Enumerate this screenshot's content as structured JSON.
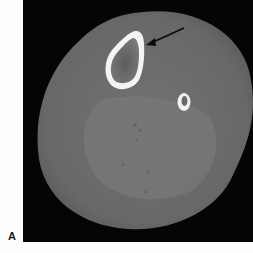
{
  "figure": {
    "panel_label": "A",
    "image_type": "axial CT slice of lower leg",
    "structures": [
      "soft-tissue-cross-section",
      "tibia",
      "fibula",
      "muscle-compartment"
    ],
    "annotation": "arrow pointing to tibia cortex",
    "colors": {
      "background": "#fdfdfd",
      "ct_background": "#050505",
      "soft_tissue": "#6b6b6b",
      "muscle": "#757575",
      "bone_cortex": "#f4f4f4",
      "marrow": "#5a5a5a",
      "arrow": "#0a0a0a"
    }
  }
}
